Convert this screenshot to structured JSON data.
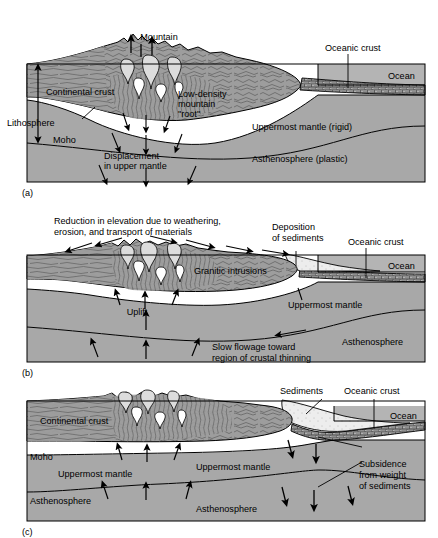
{
  "figure": {
    "type": "geologic-cross-section",
    "panel_count": 3,
    "width": 438,
    "height": 538
  },
  "colors": {
    "background": "#ffffff",
    "mantle_gray": "#a8a8a8",
    "asthenosphere_gray": "#a8a8a8",
    "crust_gray": "#9d9d9d",
    "ocean_gray": "#b4b4b4",
    "oceanic_crust_gray": "#8a8a8a",
    "sediment_white": "#eeeeee",
    "intrusion_light": "#d8d8d8",
    "outline": "#000000",
    "texture_line": "#5a5a5a"
  },
  "panels": [
    {
      "id": "a",
      "caption": "(a)",
      "labels": {
        "mountain": "Mountain",
        "oceanic_crust": "Oceanic crust",
        "ocean": "Ocean",
        "continental_crust": "Continental crust",
        "low_density_root": "Low-density\nmountain\n\"root\"",
        "low_density_root_line1": "Low-density",
        "low_density_root_line2": "mountain",
        "low_density_root_line3": "\"root\"",
        "lithosphere": "Lithosphere",
        "moho": "Moho",
        "uppermost_mantle": "Uppermost mantle (rigid)",
        "asthenosphere": "Asthenosphere (plastic)",
        "displacement_line1": "Displacement",
        "displacement_line2": "in upper mantle"
      }
    },
    {
      "id": "b",
      "caption": "(b)",
      "labels": {
        "reduction_line1": "Reduction in elevation due to weathering,",
        "reduction_line2": "erosion, and transport of materials",
        "deposition_line1": "Deposition",
        "deposition_line2": "of sediments",
        "oceanic_crust": "Oceanic crust",
        "ocean": "Ocean",
        "granitic_intrusions": "Granitic intrusions",
        "uppermost_mantle": "Uppermost mantle",
        "uplift": "Uplift",
        "asthenosphere": "Asthenosphere",
        "slow_flowage_line1": "Slow flowage toward",
        "slow_flowage_line2": "region of crustal thinning"
      }
    },
    {
      "id": "c",
      "caption": "(c)",
      "labels": {
        "sediments": "Sediments",
        "oceanic_crust": "Oceanic crust",
        "ocean": "Ocean",
        "continental_crust": "Continental crust",
        "moho": "Moho",
        "uppermost_mantle_left": "Uppermost mantle",
        "uppermost_mantle_right": "Uppermost mantle",
        "asthenosphere_left": "Asthenosphere",
        "asthenosphere_right": "Asthenosphere",
        "subsidence_line1": "Subsidence",
        "subsidence_line2": "from weight",
        "subsidence_line3": "of sediments"
      }
    }
  ]
}
